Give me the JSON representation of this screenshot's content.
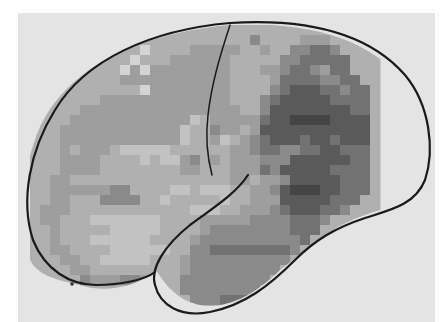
{
  "figure": {
    "type": "brain-surface-map",
    "view": "lateral-left-hemisphere",
    "background_color": "#ffffff",
    "panel_color": "#e4e4e4",
    "outline_color": "#1a1a1a",
    "grayscale_levels": [
      "#f2f2f2",
      "#d4d4d4",
      "#c2c2c2",
      "#b0b0b0",
      "#9e9e9e",
      "#8a8a8a",
      "#727272",
      "#5a5a5a",
      "#454545"
    ],
    "cell_size": 10,
    "grid_origin": [
      30,
      25
    ],
    "grid_cols": 35,
    "grid_rows": 29,
    "rows": [
      "00000000000000000000000000000000000",
      "00000000000003333333335333344400000",
      "00000000000103334444433433556650000",
      "00000000001033444444333335566666000",
      "00000000014144444444333445665466000",
      "00000000344444444444333346666556600",
      "00000003333144444444333356777665660",
      "00000034444444444444333567777766660",
      "00000444444444444444433577777777660",
      "00004444444444442344444677888877770",
      "00044444444444423354434777777777770",
      "00044444444444423342345677767767770",
      "00043444322222333333445665566776660",
      "00344443333232245343444555777777660",
      "00344443333333344333444657777766660",
      "03443333333333333333443445777776660",
      "03444444553333223222334457888776660",
      "03443335555332333332334447777766600",
      "04443333333333332223344456777665000",
      "04433322222223333444445555666500000",
      "03433333222223333455555555666000000",
      "00433322222233334555555555560000000",
      "00443333222222335566666666500000000",
      "00044332222233345555555555000000000",
      "00004433333333345555555550000000000",
      "00000544455440055555555500000000000",
      "00000000000000055555555000000000000",
      "00000000000000005556660000000000000",
      "00000000000000000000000000000000000"
    ]
  }
}
